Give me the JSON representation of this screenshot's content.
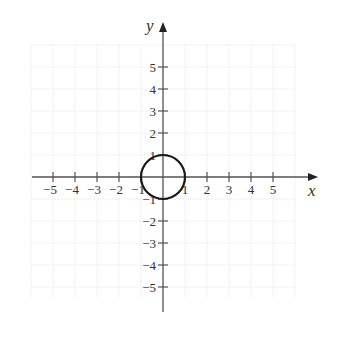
{
  "chart_data": {
    "type": "line",
    "title": "",
    "xlabel": "x",
    "ylabel": "y",
    "xlim": [
      -5,
      5
    ],
    "ylim": [
      -5,
      5
    ],
    "grid": true,
    "x_ticks": [
      -5,
      -4,
      -3,
      -2,
      -1,
      1,
      2,
      3,
      4,
      5
    ],
    "y_ticks": [
      5,
      4,
      3,
      2,
      1,
      -1,
      -2,
      -3,
      -4,
      -5
    ],
    "x_tick_labels": [
      "−5",
      "−4",
      "−3",
      "−2",
      "−1",
      "1",
      "2",
      "3",
      "4",
      "5"
    ],
    "y_tick_labels": [
      "5",
      "4",
      "3",
      "2",
      "1",
      "−1",
      "−2",
      "−3",
      "−4",
      "−5"
    ],
    "series": [
      {
        "name": "circle x^2 + y^2 = 1",
        "shape": "circle",
        "center": [
          0,
          0
        ],
        "radius": 1
      }
    ],
    "legend": null
  },
  "layout": {
    "origin_px": [
      163,
      177
    ],
    "unit_px": 22,
    "axis_color": "#555555",
    "curve_color": "#1a1a1a",
    "grid_color": "#f2f2f2"
  }
}
